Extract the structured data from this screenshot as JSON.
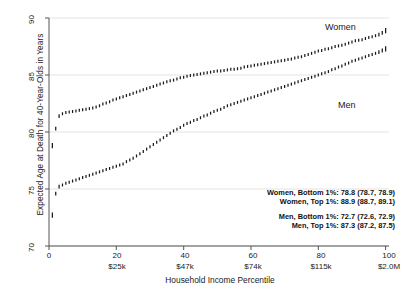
{
  "chart_data": {
    "type": "scatter",
    "title": "",
    "xlabel": "Household Income Percentile",
    "ylabel": "Expected Age at Death for 40-Year-Olds in Years",
    "xlim": [
      0,
      101
    ],
    "ylim": [
      70,
      90
    ],
    "grid": true,
    "legend_position": "inline-labels",
    "xticks": [
      {
        "value": 0,
        "label": "0",
        "sublabel": ""
      },
      {
        "value": 20,
        "label": "20",
        "sublabel": "$25k"
      },
      {
        "value": 40,
        "label": "40",
        "sublabel": "$47k"
      },
      {
        "value": 60,
        "label": "60",
        "sublabel": "$74k"
      },
      {
        "value": 80,
        "label": "80",
        "sublabel": "$115k"
      },
      {
        "value": 100,
        "label": "100",
        "sublabel": "$2.0M"
      }
    ],
    "yticks": [
      {
        "value": 70,
        "label": "70"
      },
      {
        "value": 75,
        "label": "75"
      },
      {
        "value": 80,
        "label": "80"
      },
      {
        "value": 85,
        "label": "85"
      },
      {
        "value": 90,
        "label": "90"
      }
    ],
    "series": [
      {
        "name": "Women",
        "label": "Women",
        "color": "#1a1a1a",
        "marker": "vertical-tick",
        "x": [
          1,
          2,
          3,
          4,
          5,
          6,
          7,
          8,
          9,
          10,
          11,
          12,
          13,
          14,
          15,
          16,
          17,
          18,
          19,
          20,
          21,
          22,
          23,
          24,
          25,
          26,
          27,
          28,
          29,
          30,
          31,
          32,
          33,
          34,
          35,
          36,
          37,
          38,
          39,
          40,
          41,
          42,
          43,
          44,
          45,
          46,
          47,
          48,
          49,
          50,
          51,
          52,
          53,
          54,
          55,
          56,
          57,
          58,
          59,
          60,
          61,
          62,
          63,
          64,
          65,
          66,
          67,
          68,
          69,
          70,
          71,
          72,
          73,
          74,
          75,
          76,
          77,
          78,
          79,
          80,
          81,
          82,
          83,
          84,
          85,
          86,
          87,
          88,
          89,
          90,
          91,
          92,
          93,
          94,
          95,
          96,
          97,
          98,
          99,
          100
        ],
        "values": [
          78.8,
          80.3,
          81.4,
          81.6,
          81.7,
          81.75,
          81.8,
          81.85,
          81.9,
          81.95,
          82.0,
          82.05,
          82.1,
          82.2,
          82.3,
          82.45,
          82.55,
          82.65,
          82.8,
          82.9,
          83.0,
          83.1,
          83.2,
          83.3,
          83.4,
          83.5,
          83.6,
          83.7,
          83.8,
          83.9,
          84.0,
          84.1,
          84.2,
          84.3,
          84.4,
          84.5,
          84.55,
          84.65,
          84.75,
          84.8,
          84.9,
          84.95,
          85.0,
          85.05,
          85.1,
          85.15,
          85.2,
          85.25,
          85.3,
          85.35,
          85.35,
          85.4,
          85.45,
          85.5,
          85.5,
          85.55,
          85.6,
          85.7,
          85.75,
          85.8,
          85.85,
          85.9,
          85.95,
          86.0,
          86.05,
          86.1,
          86.15,
          86.2,
          86.25,
          86.3,
          86.35,
          86.4,
          86.5,
          86.55,
          86.6,
          86.7,
          86.8,
          86.9,
          87.0,
          87.1,
          87.15,
          87.25,
          87.3,
          87.4,
          87.5,
          87.55,
          87.6,
          87.7,
          87.8,
          87.9,
          88.0,
          88.05,
          88.1,
          88.2,
          88.3,
          88.35,
          88.45,
          88.55,
          88.7,
          88.9
        ]
      },
      {
        "name": "Men",
        "label": "Men",
        "color": "#1a1a1a",
        "marker": "vertical-tick",
        "x": [
          1,
          2,
          3,
          4,
          5,
          6,
          7,
          8,
          9,
          10,
          11,
          12,
          13,
          14,
          15,
          16,
          17,
          18,
          19,
          20,
          21,
          22,
          23,
          24,
          25,
          26,
          27,
          28,
          29,
          30,
          31,
          32,
          33,
          34,
          35,
          36,
          37,
          38,
          39,
          40,
          41,
          42,
          43,
          44,
          45,
          46,
          47,
          48,
          49,
          50,
          51,
          52,
          53,
          54,
          55,
          56,
          57,
          58,
          59,
          60,
          61,
          62,
          63,
          64,
          65,
          66,
          67,
          68,
          69,
          70,
          71,
          72,
          73,
          74,
          75,
          76,
          77,
          78,
          79,
          80,
          81,
          82,
          83,
          84,
          85,
          86,
          87,
          88,
          89,
          90,
          91,
          92,
          93,
          94,
          95,
          96,
          97,
          98,
          99,
          100
        ],
        "values": [
          72.7,
          74.6,
          75.2,
          75.35,
          75.5,
          75.6,
          75.7,
          75.8,
          75.9,
          76.0,
          76.1,
          76.2,
          76.3,
          76.4,
          76.5,
          76.6,
          76.7,
          76.8,
          76.9,
          77.0,
          77.1,
          77.2,
          77.4,
          77.55,
          77.7,
          77.9,
          78.1,
          78.3,
          78.5,
          78.7,
          78.9,
          79.1,
          79.3,
          79.5,
          79.7,
          79.9,
          80.1,
          80.25,
          80.4,
          80.6,
          80.75,
          80.85,
          81.0,
          81.1,
          81.25,
          81.4,
          81.5,
          81.65,
          81.8,
          81.9,
          82.0,
          82.15,
          82.3,
          82.4,
          82.5,
          82.6,
          82.7,
          82.8,
          82.9,
          83.0,
          83.1,
          83.2,
          83.3,
          83.4,
          83.5,
          83.6,
          83.7,
          83.8,
          83.9,
          84.0,
          84.1,
          84.2,
          84.3,
          84.4,
          84.5,
          84.6,
          84.7,
          84.8,
          84.9,
          85.0,
          85.1,
          85.2,
          85.3,
          85.45,
          85.55,
          85.7,
          85.8,
          85.95,
          86.05,
          86.2,
          86.3,
          86.4,
          86.5,
          86.6,
          86.7,
          86.8,
          86.9,
          87.0,
          87.15,
          87.3
        ]
      }
    ],
    "annotations": [
      "Women, Bottom 1%: 78.8 (78.7, 78.9)",
      "Women, Top 1%: 88.9 (88.7, 89.1)",
      "Men, Bottom 1%: 72.7 (72.6, 72.9)",
      "Men, Top 1%: 87.3 (87.2, 87.5)"
    ],
    "annotation_groups": [
      [
        "Women, Bottom 1%: 78.8 (78.7, 78.9)",
        "Women, Top 1%: 88.9 (88.7, 89.1)"
      ],
      [
        "Men, Bottom 1%: 72.7 (72.6, 72.9)",
        "Men, Top 1%: 87.3 (87.2, 87.5)"
      ]
    ],
    "colors": {
      "marker": "#1a1a1a",
      "grid": "#e3e3e3",
      "axis": "#555555",
      "background": "#ffffff"
    }
  }
}
